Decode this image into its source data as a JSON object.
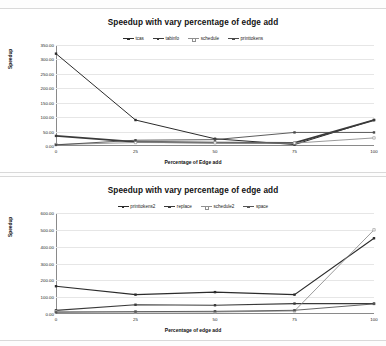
{
  "document": {
    "kind": "scanned-figure-page",
    "panel_count": 2
  },
  "charts": [
    {
      "id": "chart-top",
      "title": "Speedup with vary percentage of edge add",
      "xlabel": "Percentage of Edge add",
      "ylabel": "Speedup",
      "yticks": [
        "350.00",
        "300.00",
        "250.00",
        "200.00",
        "150.00",
        "100.00",
        "50.00",
        "0.00"
      ],
      "xticks": [
        "0",
        "25",
        "50",
        "75",
        "100"
      ],
      "legend": [
        "tcas",
        "tabinfo",
        "schedule",
        "printtokens"
      ]
    },
    {
      "id": "chart-bottom",
      "title": "Speedup with vary percentage of edge add",
      "xlabel": "Percentage of edge add",
      "ylabel": "Speedup",
      "yticks": [
        "600.00",
        "500.00",
        "400.00",
        "300.00",
        "200.00",
        "100.00",
        "0.00"
      ],
      "xticks": [
        "0",
        "25",
        "50",
        "75",
        "100"
      ],
      "legend": [
        "printtokens2",
        "replace",
        "schedule2",
        "space"
      ]
    }
  ],
  "chart_data": [
    {
      "type": "line",
      "title": "Speedup with vary percentage of edge add",
      "xlabel": "Percentage of Edge add",
      "ylabel": "Speedup",
      "x": [
        0,
        25,
        50,
        75,
        100
      ],
      "xlim": [
        0,
        100
      ],
      "ylim": [
        0,
        350
      ],
      "ytick_step": 50,
      "grid": true,
      "legend_position": "top-center",
      "series": [
        {
          "name": "tcas",
          "values": [
            320,
            90,
            25,
            5,
            90
          ],
          "color": "#2b2b2b",
          "marker": "square",
          "width": 1.0
        },
        {
          "name": "tabinfo",
          "values": [
            35,
            14,
            12,
            11,
            90
          ],
          "color": "#3a3a3a",
          "marker": "square",
          "width": 1.8
        },
        {
          "name": "schedule",
          "values": [
            5,
            12,
            11,
            10,
            28
          ],
          "color": "#8f8f8f",
          "marker": "square-hollow",
          "width": 0.9
        },
        {
          "name": "printtokens",
          "values": [
            4,
            20,
            22,
            47,
            47
          ],
          "color": "#4a4a4a",
          "marker": "square",
          "width": 0.9
        }
      ]
    },
    {
      "type": "line",
      "title": "Speedup with vary percentage of edge add",
      "xlabel": "Percentage of edge add",
      "ylabel": "Speedup",
      "x": [
        0,
        25,
        50,
        75,
        100
      ],
      "xlim": [
        0,
        100
      ],
      "ylim": [
        0,
        600
      ],
      "ytick_step": 100,
      "grid": true,
      "legend_position": "top-center",
      "series": [
        {
          "name": "printtokens2",
          "values": [
            165,
            115,
            130,
            115,
            450
          ],
          "color": "#2b2b2b",
          "marker": "square",
          "width": 1.1
        },
        {
          "name": "replace",
          "values": [
            22,
            55,
            52,
            62,
            62
          ],
          "color": "#3a3a3a",
          "marker": "square",
          "width": 1.2
        },
        {
          "name": "schedule2",
          "values": [
            14,
            12,
            12,
            18,
            500
          ],
          "color": "#8f8f8f",
          "marker": "square-hollow",
          "width": 0.9
        },
        {
          "name": "space",
          "values": [
            10,
            14,
            16,
            22,
            60
          ],
          "color": "#555555",
          "marker": "square",
          "width": 0.9
        }
      ]
    }
  ]
}
